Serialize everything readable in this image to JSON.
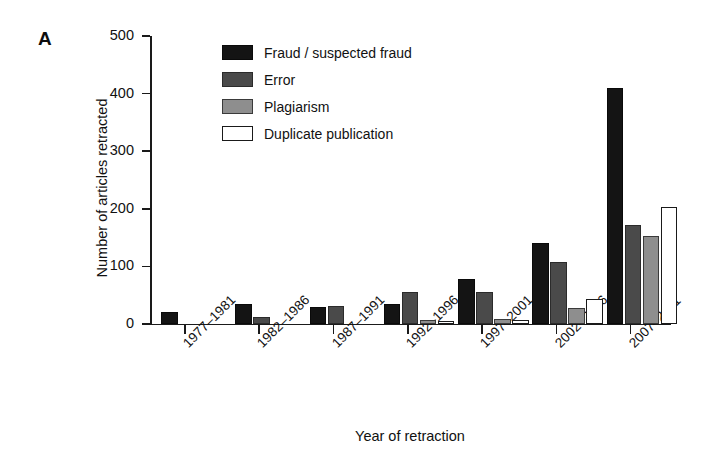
{
  "panel": {
    "label": "A"
  },
  "chart_data": {
    "type": "bar",
    "title": "",
    "xlabel": "Year of retraction",
    "ylabel": "Number of articles retracted",
    "categories": [
      "1977–1981",
      "1982–1986",
      "1987–1991",
      "1992–1996",
      "1997–2001",
      "2002–2006",
      "2007–2011"
    ],
    "series": [
      {
        "name": "Fraud / suspected fraud",
        "color": "#141414",
        "values": [
          21,
          35,
          30,
          34,
          78,
          141,
          410
        ]
      },
      {
        "name": "Error",
        "color": "#4a4a4a",
        "values": [
          0,
          12,
          32,
          55,
          56,
          108,
          172
        ]
      },
      {
        "name": "Plagiarism",
        "color": "#8e8e8e",
        "values": [
          0,
          0,
          0,
          7,
          8,
          28,
          152
        ]
      },
      {
        "name": "Duplicate publication",
        "color": "#ffffff",
        "values": [
          0,
          0,
          0,
          5,
          7,
          43,
          203
        ]
      }
    ],
    "ylim": [
      0,
      500
    ],
    "yticks": [
      0,
      100,
      200,
      300,
      400,
      500
    ],
    "ytick_labels": [
      "0",
      "100",
      "200",
      "300",
      "400",
      "500"
    ],
    "grid": false,
    "legend_position": "top-center",
    "xtick_label_rotation": -45
  }
}
